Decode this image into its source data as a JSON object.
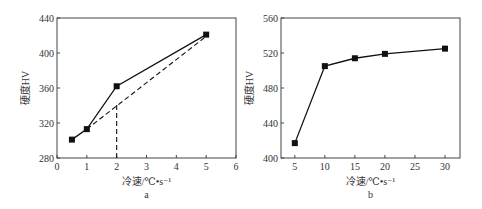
{
  "chart_data": [
    {
      "type": "line",
      "panel_label": "a",
      "xlabel": "冷速/℃•s⁻¹",
      "ylabel": "硬度HV",
      "xlim": [
        0,
        6
      ],
      "ylim": [
        280,
        440
      ],
      "xticks": [
        "0",
        "1",
        "2",
        "3",
        "4",
        "5",
        "6"
      ],
      "yticks": [
        "280",
        "320",
        "360",
        "400",
        "440"
      ],
      "grid": false,
      "series": [
        {
          "name": "measured",
          "style": "solid",
          "marker": "square",
          "x": [
            0.5,
            1,
            2,
            5
          ],
          "y": [
            301,
            313,
            362,
            421
          ]
        },
        {
          "name": "trend",
          "style": "dashed",
          "x": [
            1,
            5
          ],
          "y": [
            313,
            419
          ]
        },
        {
          "name": "marker-line",
          "style": "dashed",
          "x": [
            2,
            2
          ],
          "y": [
            280,
            341
          ]
        }
      ]
    },
    {
      "type": "line",
      "panel_label": "b",
      "xlabel": "冷速/℃•s⁻¹",
      "ylabel": "硬度HV",
      "xlim": [
        2.7,
        32.5
      ],
      "ylim": [
        400,
        560
      ],
      "xticks": [
        "5",
        "10",
        "15",
        "20",
        "25",
        "30"
      ],
      "yticks": [
        "400",
        "440",
        "480",
        "520",
        "560"
      ],
      "grid": false,
      "series": [
        {
          "name": "measured",
          "style": "solid",
          "marker": "square",
          "x": [
            5,
            10,
            15,
            20,
            30
          ],
          "y": [
            417,
            505,
            514,
            519,
            525
          ]
        }
      ]
    }
  ]
}
